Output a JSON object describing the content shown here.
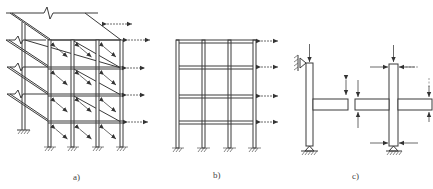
{
  "figure": {
    "panels": [
      {
        "id": "a",
        "label": "a)",
        "description": "3D multi-storey frame with floor slabs, in-plane diagonal and lateral loads"
      },
      {
        "id": "b",
        "label": "b)",
        "description": "Plane frame, 3 bays x 4 storeys, with lateral loads at each floor"
      },
      {
        "id": "c",
        "label": "c)",
        "description": "Beam-column joint sub-assemblies with applied forces"
      }
    ],
    "frame_a": {
      "bays": 3,
      "storeys": 4
    },
    "frame_b": {
      "bays": 3,
      "storeys": 4
    },
    "line_color": "#3a3a3a",
    "background": "#ffffff"
  }
}
